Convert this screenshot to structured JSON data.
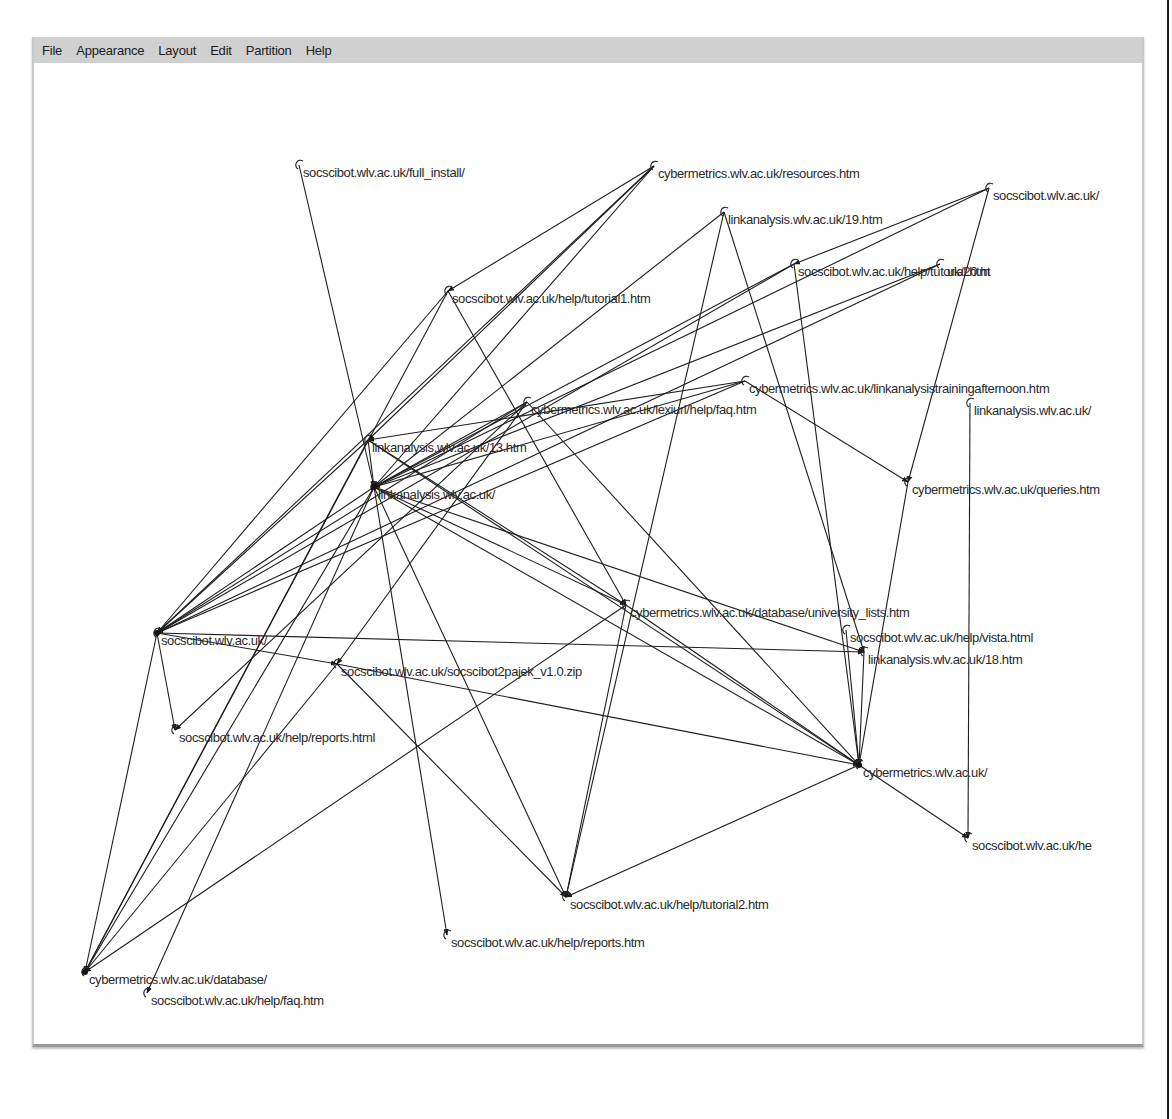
{
  "menubar": {
    "items": [
      "File",
      "Appearance",
      "Layout",
      "Edit",
      "Partition",
      "Help"
    ]
  },
  "graph": {
    "nodes": [
      {
        "id": "full_install",
        "label": "socscibot.wlv.ac.uk/full_install/",
        "x": 297,
        "y": 165,
        "hub": false
      },
      {
        "id": "resources",
        "label": "cybermetrics.wlv.ac.uk/resources.htm",
        "x": 652,
        "y": 166,
        "hub": false
      },
      {
        "id": "socsci_top_right",
        "label": "socscibot.wlv.ac.uk/",
        "x": 987,
        "y": 188,
        "hub": false
      },
      {
        "id": "la19",
        "label": "linkanalysis.wlv.ac.uk/19.htm",
        "x": 722,
        "y": 212,
        "hub": false
      },
      {
        "id": "help_tutorial",
        "label": "socscibot.wlv.ac.uk/help/tutorial.htm",
        "x": 792,
        "y": 264,
        "hub": false
      },
      {
        "id": "la20",
        "label": ".uk/20.ht",
        "x": 938,
        "y": 264,
        "hub": false
      },
      {
        "id": "tutorial1",
        "label": "socscibot.wlv.ac.uk/help/tutorial1.htm",
        "x": 446,
        "y": 291,
        "hub": false
      },
      {
        "id": "afternoon",
        "label": "cybermetrics.wlv.ac.uk/linkanalysistrainingafternoon.htm",
        "x": 743,
        "y": 381,
        "hub": false
      },
      {
        "id": "la_hidden",
        "label": "linkanalysis.wlv.ac.uk/",
        "x": 968,
        "y": 403,
        "hub": false
      },
      {
        "id": "lexiurl",
        "label": "cybermetrics.wlv.ac.uk/lexiurl/help/faq.htm",
        "x": 525,
        "y": 402,
        "hub": false
      },
      {
        "id": "la13",
        "label": "linkanalysis.wlv.ac.uk/13.htm",
        "x": 366,
        "y": 440,
        "hub": false
      },
      {
        "id": "queries",
        "label": "cybermetrics.wlv.ac.uk/queries.htm",
        "x": 906,
        "y": 482,
        "hub": false
      },
      {
        "id": "la_root",
        "label": "linkanalysis.wlv.ac.uk/",
        "x": 372,
        "y": 487,
        "hub": true
      },
      {
        "id": "univ_lists",
        "label": "cybermetrics.wlv.ac.uk/database/university_lists.htm",
        "x": 624,
        "y": 605,
        "hub": false
      },
      {
        "id": "vista",
        "label": "socscibot.wlv.ac.uk/help/vista.html",
        "x": 844,
        "y": 630,
        "hub": false
      },
      {
        "id": "socsci_root",
        "label": "socscibot.wlv.ac.uk/",
        "x": 155,
        "y": 633,
        "hub": true
      },
      {
        "id": "la18",
        "label": "linkanalysis.wlv.ac.uk/18.htm",
        "x": 862,
        "y": 652,
        "hub": false
      },
      {
        "id": "pajek",
        "label": "socscibot.wlv.ac.uk/socscibot2pajek_v1.0.zip",
        "x": 335,
        "y": 664,
        "hub": false
      },
      {
        "id": "reports_html",
        "label": "socscibot.wlv.ac.uk/help/reports.html",
        "x": 173,
        "y": 730,
        "hub": false
      },
      {
        "id": "cyber_root",
        "label": "cybermetrics.wlv.ac.uk/",
        "x": 857,
        "y": 765,
        "hub": true
      },
      {
        "id": "help_he",
        "label": "socscibot.wlv.ac.uk/he",
        "x": 966,
        "y": 838,
        "hub": false
      },
      {
        "id": "tutorial2",
        "label": "socscibot.wlv.ac.uk/help/tutorial2.htm",
        "x": 564,
        "y": 897,
        "hub": false
      },
      {
        "id": "reports_htm",
        "label": "socscibot.wlv.ac.uk/help/reports.htm",
        "x": 445,
        "y": 935,
        "hub": false
      },
      {
        "id": "database",
        "label": "cybermetrics.wlv.ac.uk/database/",
        "x": 83,
        "y": 972,
        "hub": true
      },
      {
        "id": "faq",
        "label": "socscibot.wlv.ac.uk/help/faq.htm",
        "x": 145,
        "y": 993,
        "hub": false
      }
    ],
    "edges": [
      [
        "full_install",
        "la_root"
      ],
      [
        "resources",
        "la13"
      ],
      [
        "resources",
        "la_root"
      ],
      [
        "resources",
        "tutorial1"
      ],
      [
        "resources",
        "socsci_root"
      ],
      [
        "socsci_top_right",
        "help_tutorial"
      ],
      [
        "socsci_top_right",
        "la_root"
      ],
      [
        "socsci_top_right",
        "queries"
      ],
      [
        "la19",
        "tutorial2"
      ],
      [
        "la19",
        "la_root"
      ],
      [
        "help_tutorial",
        "la_root"
      ],
      [
        "help_tutorial",
        "socsci_root"
      ],
      [
        "help_tutorial",
        "cyber_root"
      ],
      [
        "la20",
        "socsci_root"
      ],
      [
        "la20",
        "la_root"
      ],
      [
        "tutorial1",
        "univ_lists"
      ],
      [
        "tutorial1",
        "socsci_root"
      ],
      [
        "tutorial1",
        "database"
      ],
      [
        "afternoon",
        "la13"
      ],
      [
        "afternoon",
        "la_root"
      ],
      [
        "afternoon",
        "socsci_root"
      ],
      [
        "afternoon",
        "queries"
      ],
      [
        "la_hidden",
        "help_he"
      ],
      [
        "lexiurl",
        "la_root"
      ],
      [
        "lexiurl",
        "socsci_root"
      ],
      [
        "lexiurl",
        "pajek"
      ],
      [
        "lexiurl",
        "reports_html"
      ],
      [
        "lexiurl",
        "cyber_root"
      ],
      [
        "la13",
        "la_root"
      ],
      [
        "la13",
        "socsci_root"
      ],
      [
        "la13",
        "database"
      ],
      [
        "la13",
        "univ_lists"
      ],
      [
        "la13",
        "cyber_root"
      ],
      [
        "la_root",
        "socsci_root"
      ],
      [
        "la_root",
        "reports_htm"
      ],
      [
        "la_root",
        "tutorial2"
      ],
      [
        "la_root",
        "cyber_root"
      ],
      [
        "la_root",
        "univ_lists"
      ],
      [
        "la_root",
        "database"
      ],
      [
        "la_root",
        "faq"
      ],
      [
        "la_root",
        "la18"
      ],
      [
        "queries",
        "cyber_root"
      ],
      [
        "univ_lists",
        "database"
      ],
      [
        "univ_lists",
        "cyber_root"
      ],
      [
        "univ_lists",
        "tutorial2"
      ],
      [
        "vista",
        "cyber_root"
      ],
      [
        "socsci_root",
        "la18"
      ],
      [
        "socsci_root",
        "pajek"
      ],
      [
        "socsci_root",
        "database"
      ],
      [
        "socsci_root",
        "reports_html"
      ],
      [
        "la18",
        "cyber_root"
      ],
      [
        "pajek",
        "cyber_root"
      ],
      [
        "pajek",
        "tutorial2"
      ],
      [
        "pajek",
        "database"
      ],
      [
        "cyber_root",
        "help_he"
      ],
      [
        "cyber_root",
        "tutorial2"
      ],
      [
        "la19",
        "la18"
      ]
    ]
  }
}
